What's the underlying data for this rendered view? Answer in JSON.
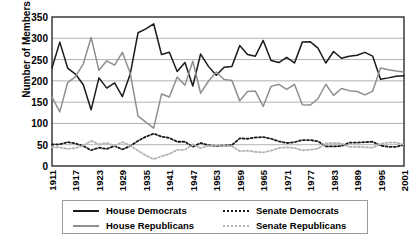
{
  "chart_data": {
    "type": "line",
    "title": "",
    "xlabel": "",
    "ylabel": "Number of Members",
    "ylim": [
      0,
      350
    ],
    "xlim": [
      1911,
      2001
    ],
    "ytick_labels": [
      "0",
      "50",
      "100",
      "150",
      "200",
      "250",
      "300",
      "350"
    ],
    "ytick_values": [
      0,
      50,
      100,
      150,
      200,
      250,
      300,
      350
    ],
    "xtick_labels": [
      "1911",
      "1917",
      "1923",
      "1929",
      "1935",
      "1941",
      "1947",
      "1953",
      "1959",
      "1965",
      "1971",
      "1977",
      "1983",
      "1989",
      "1995",
      "2001"
    ],
    "xtick_values": [
      1911,
      1917,
      1923,
      1929,
      1935,
      1941,
      1947,
      1953,
      1959,
      1965,
      1971,
      1977,
      1983,
      1989,
      1995,
      2001
    ],
    "grid": "horizontal",
    "legend_position": "below-plot",
    "x": [
      1911,
      1913,
      1915,
      1917,
      1919,
      1921,
      1923,
      1925,
      1927,
      1929,
      1931,
      1933,
      1935,
      1937,
      1939,
      1941,
      1943,
      1945,
      1947,
      1949,
      1951,
      1953,
      1955,
      1957,
      1959,
      1961,
      1963,
      1965,
      1967,
      1969,
      1971,
      1973,
      1975,
      1977,
      1979,
      1981,
      1983,
      1985,
      1987,
      1989,
      1991,
      1993,
      1995,
      1997,
      1999,
      2001
    ],
    "series": [
      {
        "name": "House Democrats",
        "color": "#1a1a1a",
        "style": "solid",
        "values": [
          230,
          291,
          230,
          216,
          191,
          132,
          207,
          183,
          195,
          163,
          216,
          313,
          322,
          334,
          262,
          267,
          222,
          243,
          188,
          263,
          234,
          213,
          232,
          234,
          283,
          262,
          258,
          295,
          248,
          243,
          255,
          242,
          291,
          292,
          277,
          242,
          269,
          253,
          258,
          260,
          267,
          258,
          204,
          207,
          211,
          212
        ]
      },
      {
        "name": "House Republicans",
        "color": "#8f8f8f",
        "style": "solid",
        "values": [
          162,
          127,
          196,
          210,
          240,
          302,
          225,
          247,
          237,
          267,
          218,
          117,
          103,
          89,
          169,
          162,
          209,
          190,
          246,
          171,
          199,
          221,
          203,
          201,
          153,
          175,
          176,
          140,
          187,
          192,
          180,
          192,
          144,
          143,
          158,
          192,
          166,
          182,
          177,
          175,
          167,
          176,
          230,
          226,
          223,
          221
        ]
      },
      {
        "name": "Senate Democrats",
        "color": "#1a1a1a",
        "style": "dotted",
        "values": [
          51,
          51,
          56,
          53,
          47,
          37,
          43,
          40,
          47,
          39,
          47,
          59,
          69,
          76,
          69,
          66,
          57,
          57,
          45,
          54,
          49,
          47,
          48,
          49,
          65,
          64,
          67,
          68,
          64,
          58,
          54,
          56,
          61,
          61,
          58,
          46,
          46,
          47,
          55,
          55,
          56,
          57,
          48,
          45,
          45,
          50
        ]
      },
      {
        "name": "Senate Republicans",
        "color": "#b3b3b3",
        "style": "dotted",
        "values": [
          44,
          44,
          40,
          42,
          48,
          59,
          51,
          54,
          48,
          56,
          48,
          36,
          25,
          16,
          23,
          28,
          38,
          38,
          51,
          42,
          47,
          48,
          47,
          47,
          35,
          36,
          33,
          32,
          36,
          42,
          44,
          42,
          37,
          38,
          41,
          53,
          54,
          53,
          45,
          45,
          44,
          43,
          52,
          55,
          55,
          50
        ]
      }
    ]
  },
  "legend": {
    "entries": [
      {
        "label": "House Democrats",
        "swatch": "solid-dark"
      },
      {
        "label": "House Republicans",
        "swatch": "solid-gray"
      },
      {
        "label": "Senate Democrats",
        "swatch": "dotted-dark"
      },
      {
        "label": "Senate Republicans",
        "swatch": "dotted-gray"
      }
    ]
  }
}
